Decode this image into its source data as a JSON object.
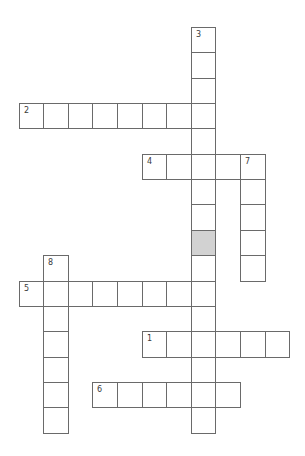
{
  "puzzle": {
    "type": "crossword",
    "layout": {
      "origin_x": 18.5,
      "origin_y": 27,
      "cell_w": 24.6,
      "cell_h": 25.35
    },
    "colors": {
      "border": "#6a6a6a",
      "blocked": "#d2d2d2",
      "number": "#3a3a3a",
      "background": "#ffffff"
    },
    "entries": [
      {
        "number": "1",
        "direction": "across",
        "row": 12,
        "col": 5,
        "length": 6
      },
      {
        "number": "2",
        "direction": "across",
        "row": 3,
        "col": 0,
        "length": 8
      },
      {
        "number": "3",
        "direction": "down",
        "row": 0,
        "col": 7,
        "length": 16
      },
      {
        "number": "4",
        "direction": "across",
        "row": 5,
        "col": 5,
        "length": 5
      },
      {
        "number": "5",
        "direction": "across",
        "row": 10,
        "col": 0,
        "length": 8
      },
      {
        "number": "6",
        "direction": "across",
        "row": 14,
        "col": 3,
        "length": 6
      },
      {
        "number": "7",
        "direction": "down",
        "row": 5,
        "col": 9,
        "length": 5
      },
      {
        "number": "8",
        "direction": "down",
        "row": 9,
        "col": 1,
        "length": 7
      }
    ],
    "blocked_cells": [
      {
        "row": 8,
        "col": 7
      }
    ],
    "answers": {}
  }
}
